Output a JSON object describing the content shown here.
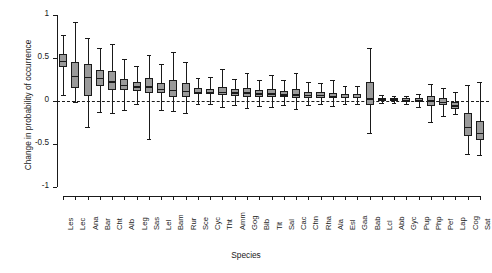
{
  "chart_data": {
    "type": "box",
    "title": "",
    "xlabel": "Species",
    "ylabel": "Change in probability of occurrence",
    "ylim": [
      -1,
      1
    ],
    "yticks": [
      1,
      0.5,
      0,
      -0.5,
      -1
    ],
    "ytick_labels": [
      "1",
      "0.5",
      "0",
      "-0.5",
      "-1"
    ],
    "grid": false,
    "reference_line": 0,
    "reference_line_style": "dashed",
    "box_fill_color": "#9a9a9a",
    "line_color": "#1a1a1a",
    "categories": [
      "Les",
      "Lec",
      "Ana",
      "Bar",
      "Cht",
      "Alb",
      "Leg",
      "Sas",
      "Lel",
      "Bam",
      "Rur",
      "Sce",
      "Cyc",
      "Tht",
      "Amm",
      "Gog",
      "Bib",
      "Tit",
      "Sal",
      "Cac",
      "Chn",
      "Rha",
      "Ala",
      "Esl",
      "Gaa",
      "Bab",
      "Lcl",
      "Abb",
      "Gyc",
      "Pup",
      "Php",
      "Pef",
      "Lap",
      "Cog",
      "Sat"
    ],
    "boxes": [
      {
        "category": "Les",
        "whisker_low": 0.07,
        "q1": 0.4,
        "median": 0.47,
        "q3": 0.55,
        "whisker_high": 0.77
      },
      {
        "category": "Lec",
        "whisker_low": -0.01,
        "q1": 0.15,
        "median": 0.29,
        "q3": 0.45,
        "whisker_high": 0.92
      },
      {
        "category": "Ana",
        "whisker_low": -0.3,
        "q1": 0.06,
        "median": 0.28,
        "q3": 0.43,
        "whisker_high": 0.73
      },
      {
        "category": "Bar",
        "whisker_low": -0.13,
        "q1": 0.17,
        "median": 0.27,
        "q3": 0.36,
        "whisker_high": 0.62
      },
      {
        "category": "Cht",
        "whisker_low": -0.14,
        "q1": 0.13,
        "median": 0.23,
        "q3": 0.35,
        "whisker_high": 0.66
      },
      {
        "category": "Alb",
        "whisker_low": -0.1,
        "q1": 0.13,
        "median": 0.19,
        "q3": 0.26,
        "whisker_high": 0.49
      },
      {
        "category": "Leg",
        "whisker_low": -0.04,
        "q1": 0.12,
        "median": 0.17,
        "q3": 0.22,
        "whisker_high": 0.41
      },
      {
        "category": "Sas",
        "whisker_low": -0.44,
        "q1": 0.09,
        "median": 0.17,
        "q3": 0.27,
        "whisker_high": 0.53
      },
      {
        "category": "Lel",
        "whisker_low": -0.1,
        "q1": 0.09,
        "median": 0.14,
        "q3": 0.21,
        "whisker_high": 0.43
      },
      {
        "category": "Bam",
        "whisker_low": -0.12,
        "q1": 0.05,
        "median": 0.13,
        "q3": 0.24,
        "whisker_high": 0.57
      },
      {
        "category": "Rur",
        "whisker_low": -0.14,
        "q1": 0.05,
        "median": 0.12,
        "q3": 0.21,
        "whisker_high": 0.45
      },
      {
        "category": "Sce",
        "whisker_low": -0.03,
        "q1": 0.08,
        "median": 0.11,
        "q3": 0.15,
        "whisker_high": 0.27
      },
      {
        "category": "Cyc",
        "whisker_low": -0.04,
        "q1": 0.08,
        "median": 0.11,
        "q3": 0.14,
        "whisker_high": 0.28
      },
      {
        "category": "Tht",
        "whisker_low": -0.07,
        "q1": 0.07,
        "median": 0.11,
        "q3": 0.16,
        "whisker_high": 0.37
      },
      {
        "category": "Amm",
        "whisker_low": -0.05,
        "q1": 0.06,
        "median": 0.1,
        "q3": 0.14,
        "whisker_high": 0.26
      },
      {
        "category": "Gog",
        "whisker_low": -0.08,
        "q1": 0.05,
        "median": 0.1,
        "q3": 0.15,
        "whisker_high": 0.33
      },
      {
        "category": "Bib",
        "whisker_low": -0.06,
        "q1": 0.05,
        "median": 0.09,
        "q3": 0.13,
        "whisker_high": 0.25
      },
      {
        "category": "Tit",
        "whisker_low": -0.07,
        "q1": 0.05,
        "median": 0.09,
        "q3": 0.14,
        "whisker_high": 0.3
      },
      {
        "category": "Sal",
        "whisker_low": -0.05,
        "q1": 0.05,
        "median": 0.08,
        "q3": 0.12,
        "whisker_high": 0.24
      },
      {
        "category": "Cac",
        "whisker_low": -0.09,
        "q1": 0.04,
        "median": 0.08,
        "q3": 0.14,
        "whisker_high": 0.33
      },
      {
        "category": "Chn",
        "whisker_low": -0.05,
        "q1": 0.04,
        "median": 0.07,
        "q3": 0.11,
        "whisker_high": 0.22
      },
      {
        "category": "Rha",
        "whisker_low": -0.04,
        "q1": 0.04,
        "median": 0.07,
        "q3": 0.1,
        "whisker_high": 0.21
      },
      {
        "category": "Ala",
        "whisker_low": -0.06,
        "q1": 0.03,
        "median": 0.06,
        "q3": 0.09,
        "whisker_high": 0.24
      },
      {
        "category": "Esl",
        "whisker_low": -0.04,
        "q1": 0.03,
        "median": 0.05,
        "q3": 0.08,
        "whisker_high": 0.18
      },
      {
        "category": "Gaa",
        "whisker_low": -0.04,
        "q1": 0.03,
        "median": 0.05,
        "q3": 0.08,
        "whisker_high": 0.18
      },
      {
        "category": "Bab",
        "whisker_low": -0.37,
        "q1": -0.05,
        "median": 0.03,
        "q3": 0.22,
        "whisker_high": 0.62
      },
      {
        "category": "Lcl",
        "whisker_low": -0.02,
        "q1": 0.01,
        "median": 0.02,
        "q3": 0.04,
        "whisker_high": 0.07
      },
      {
        "category": "Abb",
        "whisker_low": -0.02,
        "q1": 0.01,
        "median": 0.02,
        "q3": 0.03,
        "whisker_high": 0.06
      },
      {
        "category": "Gyc",
        "whisker_low": -0.03,
        "q1": 0.0,
        "median": 0.01,
        "q3": 0.03,
        "whisker_high": 0.06
      },
      {
        "category": "Pup",
        "whisker_low": -0.07,
        "q1": -0.01,
        "median": 0.01,
        "q3": 0.03,
        "whisker_high": 0.08
      },
      {
        "category": "Php",
        "whisker_low": -0.24,
        "q1": -0.06,
        "median": 0.01,
        "q3": 0.06,
        "whisker_high": 0.2
      },
      {
        "category": "Pef",
        "whisker_low": -0.17,
        "q1": -0.05,
        "median": -0.01,
        "q3": 0.04,
        "whisker_high": 0.15
      },
      {
        "category": "Lap",
        "whisker_low": -0.15,
        "q1": -0.09,
        "median": -0.05,
        "q3": -0.01,
        "whisker_high": 0.1
      },
      {
        "category": "Cog",
        "whisker_low": -0.62,
        "q1": -0.41,
        "median": -0.3,
        "q3": -0.14,
        "whisker_high": 0.19
      },
      {
        "category": "Sat",
        "whisker_low": -0.63,
        "q1": -0.45,
        "median": -0.37,
        "q3": -0.23,
        "whisker_high": 0.22
      }
    ]
  }
}
